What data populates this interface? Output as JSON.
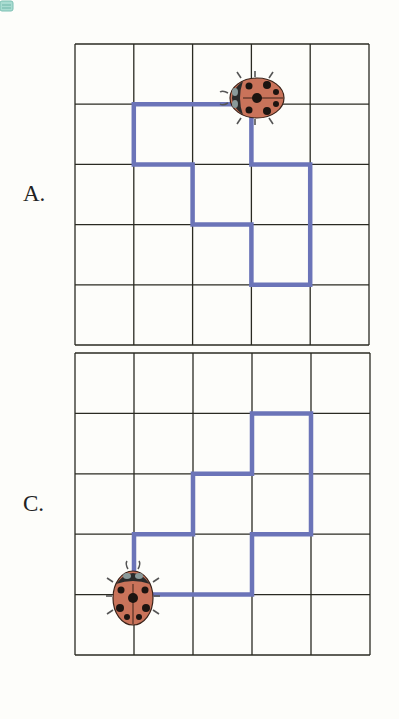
{
  "options": [
    {
      "label": "A.",
      "grid": {
        "x": 75,
        "y": 44,
        "cols": 5,
        "rows": 5,
        "cell_w": 58.8,
        "cell_h": 60.2
      },
      "path": [
        [
          3,
          1
        ],
        [
          1,
          1
        ],
        [
          1,
          2
        ],
        [
          2,
          2
        ],
        [
          2,
          3
        ],
        [
          3,
          3
        ],
        [
          3,
          4
        ],
        [
          4,
          4
        ],
        [
          4,
          2
        ],
        [
          3,
          2
        ],
        [
          3,
          1
        ]
      ],
      "ladybug": {
        "x": 255,
        "y": 98,
        "facing": "left"
      }
    },
    {
      "label": "C.",
      "grid": {
        "x": 75,
        "y": 353,
        "cols": 5,
        "rows": 5,
        "cell_w": 59,
        "cell_h": 60.4
      },
      "path": [
        [
          1,
          4
        ],
        [
          1,
          3
        ],
        [
          2,
          3
        ],
        [
          2,
          2
        ],
        [
          3,
          2
        ],
        [
          3,
          1
        ],
        [
          4,
          1
        ],
        [
          4,
          3
        ],
        [
          3,
          3
        ],
        [
          3,
          4
        ],
        [
          1,
          4
        ]
      ],
      "ladybug": {
        "x": 133,
        "y": 596,
        "facing": "up"
      }
    }
  ],
  "colors": {
    "grid_line": "#2a2a22",
    "path": "#6b74b8",
    "ladybug_body": "#c9735a",
    "ladybug_spots": "#1c1410",
    "ladybug_head": "#2a2a2a",
    "background": "#fdfdfa",
    "corner_icon": "#8fcfc3"
  }
}
